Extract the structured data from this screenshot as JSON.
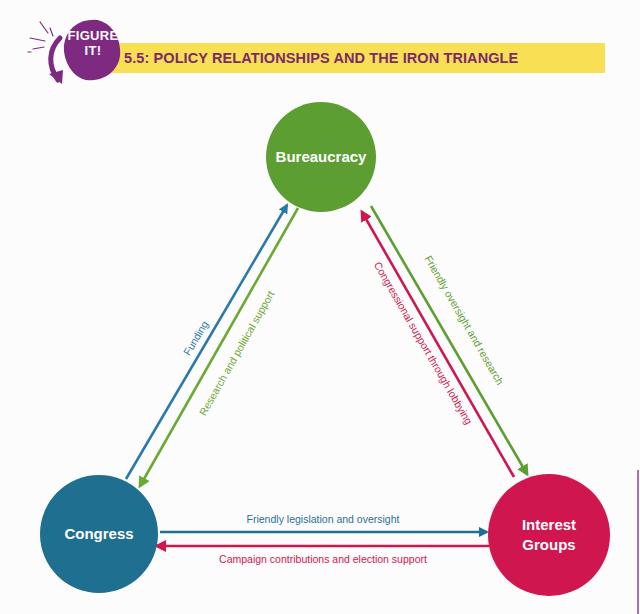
{
  "badge": {
    "text": "FIGURE\nIT!",
    "line1": "FIGURE",
    "line2": "IT!",
    "color": "#7d2a80"
  },
  "header": {
    "title": "5.5: POLICY RELATIONSHIPS AND THE IRON TRIANGLE",
    "bar_color": "#f8df54",
    "text_color": "#7b2a6b"
  },
  "nodes": {
    "bureaucracy": {
      "label": "Bureaucracy",
      "color": "#5c9e32"
    },
    "congress": {
      "label": "Congress",
      "color": "#1f6f90"
    },
    "interest_groups": {
      "label": "Interest\nGroups",
      "color": "#d0164e"
    }
  },
  "edges": [
    {
      "id": "funding",
      "from": "Congress",
      "to": "Bureaucracy",
      "label": "Funding",
      "color": "#2a79a8"
    },
    {
      "id": "research-political-support",
      "from": "Bureaucracy",
      "to": "Congress",
      "label": "Research and political support",
      "color": "#6aa933"
    },
    {
      "id": "congressional-support-lobbying",
      "from": "Interest Groups",
      "to": "Bureaucracy",
      "label": "Congressional support through lobbying",
      "color": "#d0164e"
    },
    {
      "id": "friendly-oversight-research",
      "from": "Bureaucracy",
      "to": "Interest Groups",
      "label": "Friendly oversight and research",
      "color": "#5c9e32"
    },
    {
      "id": "friendly-legislation-oversight",
      "from": "Congress",
      "to": "Interest Groups",
      "label": "Friendly legislation and oversight",
      "color": "#1f6f90"
    },
    {
      "id": "campaign-contributions",
      "from": "Interest Groups",
      "to": "Congress",
      "label": "Campaign contributions and election support",
      "color": "#d0164e"
    }
  ]
}
